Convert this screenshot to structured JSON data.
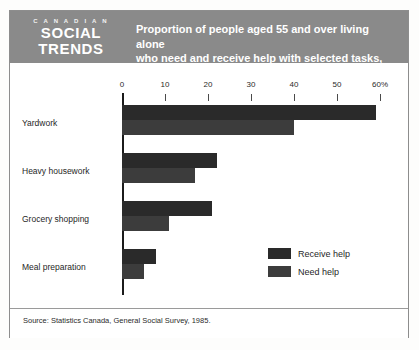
{
  "publication": {
    "logo_kicker": "C A N A D I A N",
    "logo_line1": "SOCIAL",
    "logo_line2": "TRENDS"
  },
  "header": {
    "title_line1": "Proportion of people aged 55 and over living alone",
    "title_line2": "who need and receive help with selected tasks, 1985",
    "band_color": "#8a8a8a",
    "text_color": "#ffffff"
  },
  "source": {
    "note": "Source: Statistics Canada, General Social Survey, 1985."
  },
  "legend": {
    "position": "inside-bottom-right",
    "entries": [
      {
        "label": "Receive help",
        "color": "#2a2a2a"
      },
      {
        "label": "Need help",
        "color": "#3c3c3c"
      }
    ]
  },
  "chart_data": {
    "type": "bar",
    "orientation": "horizontal",
    "title": "Proportion of people aged 55 and over living alone who need and receive help with selected tasks, 1985",
    "subtitle": "",
    "xlabel": "",
    "ylabel": "",
    "xlim": [
      0,
      60
    ],
    "xticks": [
      0,
      10,
      20,
      30,
      40,
      50,
      60
    ],
    "xtick_labels": [
      "0",
      "10",
      "20",
      "30",
      "40",
      "50",
      "60%"
    ],
    "unit": "%",
    "grid": false,
    "categories": [
      "Yardwork",
      "Heavy housework",
      "Grocery shopping",
      "Meal preparation"
    ],
    "series": [
      {
        "name": "Receive help",
        "color": "#2a2a2a",
        "values": [
          59,
          22,
          21,
          8
        ]
      },
      {
        "name": "Need help",
        "color": "#3c3c3c",
        "values": [
          40,
          17,
          11,
          5
        ]
      }
    ]
  }
}
